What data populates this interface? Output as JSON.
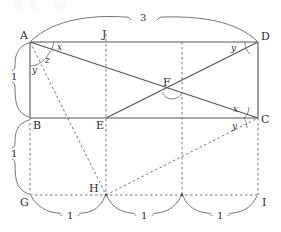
{
  "figure": {
    "stroke_color": "#555555",
    "dash_color": "#777777",
    "text_color": "#2b2b2b",
    "width": 281,
    "height": 232
  },
  "vertices": {
    "A": "A",
    "B": "B",
    "C": "C",
    "D": "D",
    "E": "E",
    "F": "F",
    "G": "G",
    "H": "H",
    "I": "I",
    "J": "J"
  },
  "angles": {
    "a_x": "x",
    "a_z": "z",
    "a_y": "y",
    "d_y": "y",
    "c_x": "x",
    "c_y": "y"
  },
  "measures": {
    "top_span": "3",
    "left_upper": "1",
    "left_lower": "1",
    "bottom_1": "1",
    "bottom_2": "1",
    "bottom_3": "1"
  },
  "geometry": {
    "rect_left": 30,
    "rect_right": 258,
    "rect_top": 42,
    "rect_bottom": 118,
    "bottom_line_y": 195,
    "dash_x1": 106,
    "dash_x2": 182,
    "point_F_x": 172,
    "point_F_y": 88,
    "point_H_x": 106,
    "point_H_y": 195
  }
}
